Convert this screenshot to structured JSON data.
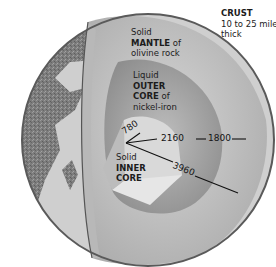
{
  "diagram": {
    "colors": {
      "background": "#ffffff",
      "land": "#7a7a7a",
      "ocean": "#c9c9c9",
      "crust_edge": "#555555",
      "mantle": "#c4c4c4",
      "outer_core": "#9c9c9c",
      "inner_core": "#d8d8d8",
      "text": "#1c1c1c"
    },
    "layers": {
      "crust": {
        "title": "CRUST",
        "line2": "10 to 25 miles",
        "line3": "thick"
      },
      "mantle": {
        "line1": "Solid",
        "line2_bold": "MANTLE",
        "line2_rest": " of",
        "line3": "olivine rock"
      },
      "outer_core": {
        "line1": "Liquid",
        "line2_bold": "OUTER",
        "line3_bold": "CORE",
        "line3_rest": " of",
        "line4": "nickel-iron"
      },
      "inner_core": {
        "line1": "Solid",
        "line2_bold": "INNER",
        "line3_bold": "CORE"
      }
    },
    "measurements": {
      "inner_core_radius": "780",
      "outer_core_thickness": "2160",
      "mantle_thickness": "1800",
      "earth_radius": "3960"
    }
  }
}
